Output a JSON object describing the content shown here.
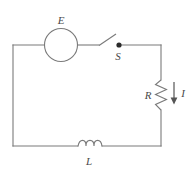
{
  "figure": {
    "type": "circuit-diagram",
    "background_color": "#ffffff",
    "wire_color": "#7a7a7a",
    "label_color": "#4a4a4a",
    "node_color": "#2b2b2b"
  },
  "labels": {
    "emf": "E",
    "switch": "S",
    "resistor": "R",
    "inductor": "L",
    "current": "I"
  },
  "components": {
    "emf_source": {
      "name": "emf-source",
      "symbol": "circle",
      "label": "E",
      "center_x": 61,
      "center_y": 45,
      "radius": 16.5
    },
    "switch": {
      "name": "switch",
      "symbol": "open-blade",
      "label": "S",
      "pivot_x": 99,
      "pivot_y": 45.5,
      "tip_x": 116,
      "tip_y": 34,
      "node_x": 119,
      "node_y": 45,
      "state": "open"
    },
    "resistor": {
      "name": "resistor",
      "symbol": "zigzag",
      "label": "R",
      "x": 161,
      "y_top": 80,
      "y_bottom": 110,
      "orientation": "vertical"
    },
    "inductor": {
      "name": "inductor",
      "symbol": "coil",
      "label": "L",
      "x_start": 78,
      "x_end": 102,
      "y": 146,
      "loops": 3,
      "orientation": "horizontal"
    },
    "current_arrow": {
      "name": "current-arrow",
      "label": "I",
      "direction": "down",
      "x": 174,
      "y_start": 82,
      "y_end": 104
    }
  },
  "frame": {
    "left": 13,
    "right": 161,
    "top": 45,
    "bottom": 146
  }
}
